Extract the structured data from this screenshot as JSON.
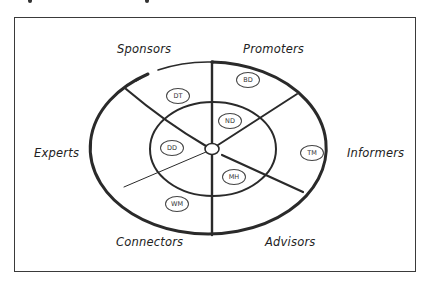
{
  "diagram": {
    "title": "",
    "segments": [
      {
        "label": "Sponsors",
        "position": "top-left"
      },
      {
        "label": "Promoters",
        "position": "top-right"
      },
      {
        "label": "Informers",
        "position": "right"
      },
      {
        "label": "Advisors",
        "position": "bottom-right"
      },
      {
        "label": "Connectors",
        "position": "bottom-left"
      },
      {
        "label": "Experts",
        "position": "left"
      }
    ],
    "people": [
      {
        "initials": "BD",
        "segment": "Promoters",
        "ring": "outer"
      },
      {
        "initials": "DT",
        "segment": "Sponsors",
        "ring": "outer"
      },
      {
        "initials": "ND",
        "segment": "Promoters",
        "ring": "inner"
      },
      {
        "initials": "DD",
        "segment": "Experts",
        "ring": "inner"
      },
      {
        "initials": "TM",
        "segment": "Informers",
        "ring": "outer"
      },
      {
        "initials": "MH",
        "segment": "Advisors",
        "ring": "inner"
      },
      {
        "initials": "WM",
        "segment": "Connectors",
        "ring": "outer"
      }
    ],
    "colors": {
      "stroke": "#2a2a2a",
      "frame": "#3a3a3a",
      "background": "#ffffff"
    }
  }
}
